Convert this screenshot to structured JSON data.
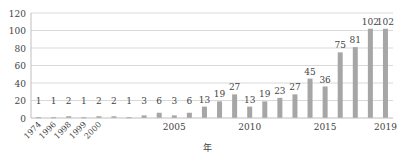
{
  "chart_data": {
    "type": "bar",
    "title": "",
    "xlabel": "年",
    "ylabel": "",
    "ylim": [
      0,
      120
    ],
    "yticks": [
      0,
      20,
      40,
      60,
      80,
      100,
      120
    ],
    "grid": true,
    "legend": null,
    "categories": [
      "1974",
      "1996",
      "1998",
      "1999",
      "2000",
      "2001",
      "2002",
      "2003",
      "2004",
      "2005",
      "2006",
      "2007",
      "2008",
      "2009",
      "2010",
      "2011",
      "2012",
      "2013",
      "2014",
      "2015",
      "2016",
      "2017",
      "2018",
      "2019"
    ],
    "values": [
      1,
      1,
      2,
      1,
      2,
      2,
      1,
      3,
      6,
      3,
      6,
      13,
      19,
      27,
      13,
      19,
      23,
      27,
      45,
      36,
      75,
      81,
      102,
      102
    ],
    "xtick_labels_rotated": [
      "1974",
      "1996",
      "1998",
      "1999",
      "2000"
    ],
    "xtick_labels_horizontal": [
      "2005",
      "2010",
      "2015",
      "2019"
    ],
    "bar_color": "#a6a6a6",
    "grid_color": "#d9d9d9"
  }
}
